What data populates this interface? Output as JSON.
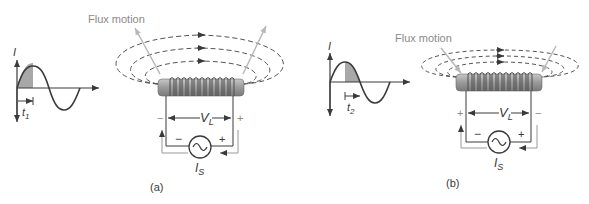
{
  "figure": {
    "panels": [
      {
        "id": "a",
        "caption": "(a)",
        "graph": {
          "y_axis_label": "I",
          "time_marker_label": "t",
          "time_marker_subscript": "1",
          "shaded_region": "rising quarter of positive half-cycle"
        },
        "flux_label": "Flux motion",
        "voltage_label": "V",
        "voltage_subscript": "L",
        "voltage_left_polarity": "−",
        "voltage_right_polarity": "+",
        "source_left_polarity": "−",
        "source_right_polarity": "+",
        "source_label": "I",
        "source_subscript": "S"
      },
      {
        "id": "b",
        "caption": "(b)",
        "graph": {
          "y_axis_label": "I",
          "time_marker_label": "t",
          "time_marker_subscript": "2",
          "shaded_region": "falling quarter of positive half-cycle"
        },
        "flux_label": "Flux motion",
        "voltage_label": "V",
        "voltage_subscript": "L",
        "voltage_left_polarity": "+",
        "voltage_right_polarity": "−",
        "source_left_polarity": "−",
        "source_right_polarity": "+",
        "source_label": "I",
        "source_subscript": "S"
      }
    ],
    "colors": {
      "line": "#3a3a3a",
      "shade": "#a8a8a8",
      "coil_core": "#9a9a9a",
      "flux_arrow": "#b8b8b8",
      "label_gray": "#8a8a8a"
    }
  }
}
